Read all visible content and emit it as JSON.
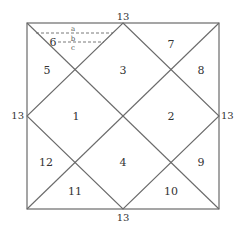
{
  "diagram": {
    "type": "north-indian-chart",
    "edge_labels": {
      "top": "13",
      "left": "13",
      "right": "13",
      "bottom": "13"
    },
    "houses": [
      {
        "id": 1,
        "label": "1"
      },
      {
        "id": 2,
        "label": "2"
      },
      {
        "id": 3,
        "label": "3"
      },
      {
        "id": 4,
        "label": "4"
      },
      {
        "id": 5,
        "label": "5"
      },
      {
        "id": 6,
        "label": "6"
      },
      {
        "id": 7,
        "label": "7"
      },
      {
        "id": 8,
        "label": "8"
      },
      {
        "id": 9,
        "label": "9"
      },
      {
        "id": 10,
        "label": "10"
      },
      {
        "id": 11,
        "label": "11"
      },
      {
        "id": 12,
        "label": "12"
      }
    ],
    "dashed_markers": {
      "a": "a",
      "b": "b",
      "c": "c"
    },
    "colors": {
      "line": "#6a6a6a",
      "text": "#333333",
      "background": "#ffffff"
    }
  }
}
